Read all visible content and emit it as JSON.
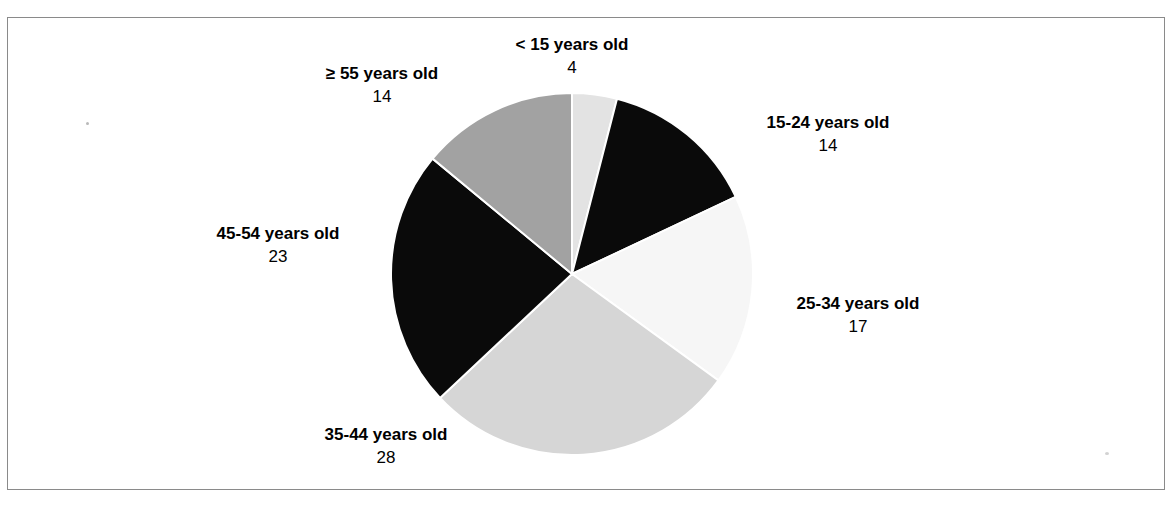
{
  "figure": {
    "clipped_caption": "",
    "background_color": "#ffffff",
    "frame_color": "#8a8a8a"
  },
  "chart_data": {
    "type": "pie",
    "title": "",
    "subtitle": "",
    "xlabel": "",
    "ylabel": "",
    "legend_position": "outside-labels",
    "grid": false,
    "total": 100,
    "start_angle_deg": 0,
    "direction": "clockwise",
    "categories": [
      "< 15 years old",
      "15-24 years old",
      "25-34 years old",
      "35-44 years old",
      "45-54 years old",
      "≥ 55 years old"
    ],
    "values": [
      4,
      14,
      17,
      28,
      23,
      14
    ],
    "colors": [
      "#e3e3e3",
      "#0a0a0a",
      "#f6f6f6",
      "#d6d6d6",
      "#0a0a0a",
      "#a2a2a2"
    ],
    "slices": [
      {
        "label": "< 15 years old",
        "value": 4,
        "value_text": "4",
        "color": "#e3e3e3"
      },
      {
        "label": "15-24 years old",
        "value": 14,
        "value_text": "14",
        "color": "#0a0a0a"
      },
      {
        "label": "25-34 years old",
        "value": 17,
        "value_text": "17",
        "color": "#f6f6f6"
      },
      {
        "label": "35-44 years old",
        "value": 28,
        "value_text": "28",
        "color": "#d6d6d6"
      },
      {
        "label": "45-54 years old",
        "value": 23,
        "value_text": "23",
        "color": "#0a0a0a"
      },
      {
        "label": "≥ 55 years old",
        "value": 14,
        "value_text": "14",
        "color": "#a2a2a2"
      }
    ],
    "geometry": {
      "center_x": 572,
      "center_y": 274,
      "radius": 181
    }
  }
}
